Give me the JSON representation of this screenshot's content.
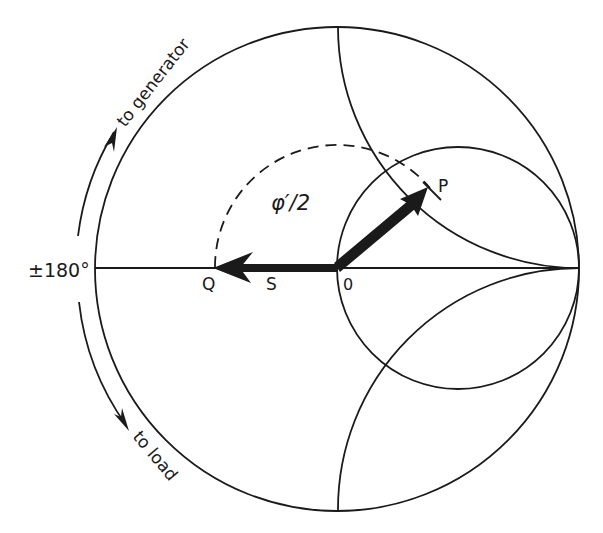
{
  "diagram": {
    "type": "smith-chart",
    "ink_color": "#1a1a1a",
    "background": "#ffffff",
    "labels": {
      "angle": "±180°",
      "to_generator": "to generator",
      "to_load": "to load",
      "phase": "φ′/2",
      "point_p": "P",
      "point_q": "Q",
      "point_s": "S",
      "origin": "0"
    },
    "elements": {
      "outer_circle": "unit reflection circle |Γ|=1",
      "inner_circle": "constant resistance circle r=1",
      "upper_arc": "reactance arc x=+1",
      "lower_arc": "reactance arc x=-1",
      "real_axis": "horizontal real axis",
      "dashed_arc": "rotation arc from P to Q (φ′/2)",
      "vector_op": "vector from O to P",
      "vector_oq": "vector from O to Q",
      "arrow_to_generator": "direction arrow toward generator (clockwise up)",
      "arrow_to_load": "direction arrow toward load (downward)"
    }
  }
}
